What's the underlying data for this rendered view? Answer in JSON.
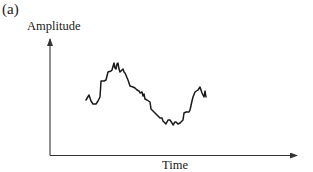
{
  "figure": {
    "panel_label": "(a)",
    "y_axis_label": "Amplitude",
    "x_axis_label": "Time",
    "colors": {
      "axis": "#333333",
      "signal": "#1a1a1a",
      "background": "#ffffff"
    }
  },
  "chart_data": {
    "type": "line",
    "title": "(a)",
    "xlabel": "Time",
    "ylabel": "Amplitude",
    "grid": false,
    "ticks": false,
    "series": [
      {
        "name": "signal",
        "points_px": [
          [
            86,
            100
          ],
          [
            89,
            95
          ],
          [
            91,
            101
          ],
          [
            93,
            104
          ],
          [
            96,
            104
          ],
          [
            98,
            101
          ],
          [
            100,
            97
          ],
          [
            101,
            81
          ],
          [
            104,
            81
          ],
          [
            106,
            80
          ],
          [
            108,
            72
          ],
          [
            111,
            71
          ],
          [
            112,
            70
          ],
          [
            114,
            63
          ],
          [
            115,
            68
          ],
          [
            116,
            69
          ],
          [
            117,
            64
          ],
          [
            118,
            63
          ],
          [
            119,
            69
          ],
          [
            120,
            72
          ],
          [
            122,
            70
          ],
          [
            123,
            69
          ],
          [
            124,
            72
          ],
          [
            125,
            73
          ],
          [
            128,
            80
          ],
          [
            130,
            86
          ],
          [
            133,
            87
          ],
          [
            135,
            88
          ],
          [
            137,
            90
          ],
          [
            139,
            91
          ],
          [
            140,
            93
          ],
          [
            142,
            92
          ],
          [
            143,
            96
          ],
          [
            144,
            94
          ],
          [
            145,
            99
          ],
          [
            147,
            100
          ],
          [
            150,
            102
          ],
          [
            151,
            109
          ],
          [
            153,
            111
          ],
          [
            156,
            114
          ],
          [
            160,
            118
          ],
          [
            162,
            118
          ],
          [
            163,
            121
          ],
          [
            165,
            123
          ],
          [
            166,
            124
          ],
          [
            168,
            120
          ],
          [
            170,
            120
          ],
          [
            172,
            123
          ],
          [
            173,
            125
          ],
          [
            175,
            122
          ],
          [
            176,
            122
          ],
          [
            178,
            124
          ],
          [
            180,
            123
          ],
          [
            182,
            121
          ],
          [
            183,
            120
          ],
          [
            184,
            113
          ],
          [
            186,
            112
          ],
          [
            189,
            112
          ],
          [
            190,
            110
          ],
          [
            192,
            101
          ],
          [
            193,
            97
          ],
          [
            195,
            92
          ],
          [
            198,
            90
          ],
          [
            200,
            87
          ],
          [
            202,
            93
          ],
          [
            204,
            97
          ],
          [
            205,
            91
          ],
          [
            206,
            97
          ]
        ]
      }
    ]
  }
}
